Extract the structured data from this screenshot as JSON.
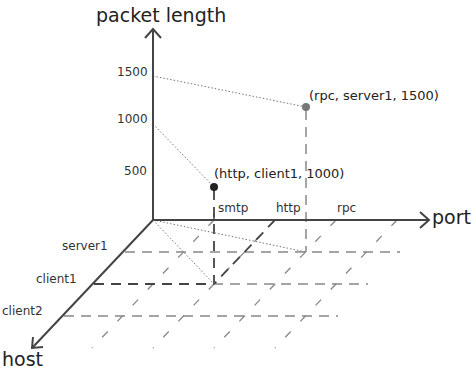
{
  "diagram": {
    "type": "3d-axes",
    "axes": {
      "y": {
        "label": "packet length",
        "ticks": [
          "500",
          "1000",
          "1500"
        ]
      },
      "x": {
        "label": "port",
        "ticks": [
          "smtp",
          "http",
          "rpc"
        ]
      },
      "z": {
        "label": "host",
        "ticks": [
          "server1",
          "client1",
          "client2"
        ]
      }
    },
    "points": [
      {
        "label": "(http, client1, 1000)",
        "port": "http",
        "host": "client1",
        "packet_length": 1000,
        "color": "#222222"
      },
      {
        "label": "(rpc, server1, 1500)",
        "port": "rpc",
        "host": "server1",
        "packet_length": 1500,
        "color": "#777777"
      }
    ],
    "colors": {
      "axis": "#444444",
      "grid": "#888888",
      "guide": "#777777"
    }
  }
}
